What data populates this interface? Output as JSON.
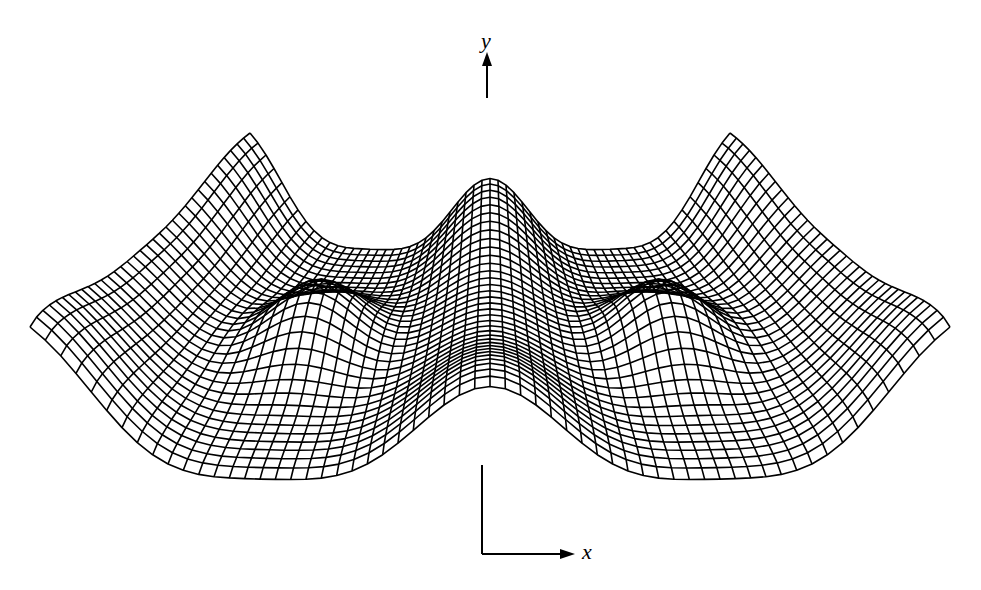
{
  "figure": {
    "caption_clipped": "",
    "y_axis_label": "y",
    "x_axis_label": "x",
    "line_color": "#000000",
    "background_color": "#ffffff"
  },
  "mesh": {
    "type": "3d-wireframe-surface",
    "description": "Periodic surface with peaks, viewed in perspective",
    "rows": 34,
    "cols": 60
  }
}
